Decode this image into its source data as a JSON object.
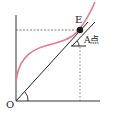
{
  "diagram": {
    "labels": {
      "origin": "O",
      "point_e": "E",
      "point_a": "A点"
    },
    "colors": {
      "curve": "#e07a92",
      "lines": "#222222",
      "dashed": "#555555",
      "point": "#1a1a1a"
    }
  }
}
